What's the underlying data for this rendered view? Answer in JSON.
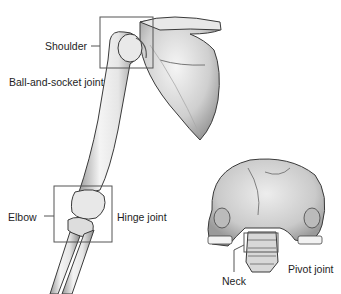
{
  "diagram": {
    "labels": {
      "shoulder": "Shoulder",
      "ball_socket": "Ball-and-socket joint",
      "elbow": "Elbow",
      "hinge": "Hinge joint",
      "neck": "Neck",
      "pivot": "Pivot joint"
    },
    "callout_boxes": [
      {
        "name": "shoulder-box",
        "x": 100,
        "y": 17,
        "w": 53,
        "h": 51
      },
      {
        "name": "elbow-box",
        "x": 54,
        "y": 186,
        "w": 58,
        "h": 56
      },
      {
        "name": "neck-box",
        "x": 244,
        "y": 233,
        "w": 34,
        "h": 19
      }
    ],
    "colors": {
      "bone_light": "#f2f2f2",
      "bone_mid": "#c9c9c9",
      "bone_dark": "#8a8a8a",
      "outline": "#3a3a3a",
      "box": "#555555"
    }
  }
}
